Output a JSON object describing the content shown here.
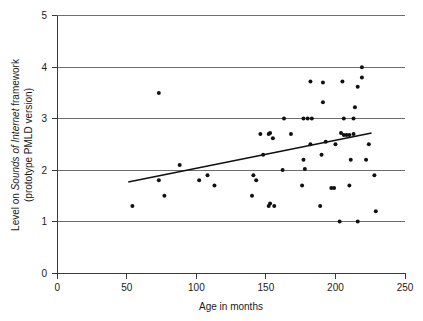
{
  "chart_data": {
    "type": "scatter",
    "title": "",
    "xlabel": "Age in months",
    "ylabel_line1_pre": "Level on ",
    "ylabel_line1_italic": "Sounds of Internet",
    "ylabel_line1_post": " framework",
    "ylabel_line2": "(prototype PMLD version)",
    "ylabel_plain": "Level on Sounds of Internet framework (prototype PMLD version)",
    "xlim": [
      0,
      250
    ],
    "ylim": [
      0,
      5
    ],
    "xticks": [
      0,
      50,
      100,
      150,
      200,
      250
    ],
    "yticks": [
      0,
      1,
      2,
      3,
      4,
      5
    ],
    "xtick_labels": [
      "0",
      "50",
      "100",
      "150",
      "200",
      "250"
    ],
    "ytick_labels": [
      "0",
      "1",
      "2",
      "3",
      "4",
      "5"
    ],
    "grid": "horizontal",
    "legend": "none",
    "marker": "filled-circle",
    "marker_color": "#111111",
    "gridline_color": "#6e6e6e",
    "axis_color": "#3a3a3a",
    "background": "#ffffff",
    "series": [
      {
        "name": "Participants",
        "points": [
          [
            54,
            1.3
          ],
          [
            73,
            3.5
          ],
          [
            73,
            1.8
          ],
          [
            77,
            1.5
          ],
          [
            88,
            2.1
          ],
          [
            102,
            1.8
          ],
          [
            108,
            1.9
          ],
          [
            113,
            1.7
          ],
          [
            140,
            1.5
          ],
          [
            141,
            1.9
          ],
          [
            143,
            1.8
          ],
          [
            146,
            2.7
          ],
          [
            148,
            2.3
          ],
          [
            152,
            2.7
          ],
          [
            153,
            2.72
          ],
          [
            155,
            2.62
          ],
          [
            152,
            1.3
          ],
          [
            156,
            1.3
          ],
          [
            153,
            1.35
          ],
          [
            162,
            2.0
          ],
          [
            163,
            3.0
          ],
          [
            168,
            2.7
          ],
          [
            176,
            1.7
          ],
          [
            177,
            2.2
          ],
          [
            177,
            3.0
          ],
          [
            178,
            2.02
          ],
          [
            180,
            3.0
          ],
          [
            182,
            2.5
          ],
          [
            183,
            3.0
          ],
          [
            182,
            3.72
          ],
          [
            189,
            1.3
          ],
          [
            190,
            2.3
          ],
          [
            191,
            3.32
          ],
          [
            191,
            3.7
          ],
          [
            193,
            2.55
          ],
          [
            197,
            1.65
          ],
          [
            199,
            1.65
          ],
          [
            200,
            2.5
          ],
          [
            203,
            1.0
          ],
          [
            204,
            2.72
          ],
          [
            205,
            3.72
          ],
          [
            206,
            3.0
          ],
          [
            206,
            2.68
          ],
          [
            208,
            2.68
          ],
          [
            210,
            2.68
          ],
          [
            210,
            1.7
          ],
          [
            211,
            2.2
          ],
          [
            213,
            3.0
          ],
          [
            213,
            2.7
          ],
          [
            214,
            3.22
          ],
          [
            216,
            1.0
          ],
          [
            216,
            3.62
          ],
          [
            219,
            4.0
          ],
          [
            219,
            3.8
          ],
          [
            222,
            2.2
          ],
          [
            224,
            2.5
          ],
          [
            228,
            1.9
          ],
          [
            229,
            1.2
          ]
        ]
      }
    ],
    "trendline": {
      "name": "Linear fit",
      "x_start": 51,
      "y_start": 1.77,
      "x_end": 226,
      "y_end": 2.72,
      "color": "#111111"
    }
  }
}
